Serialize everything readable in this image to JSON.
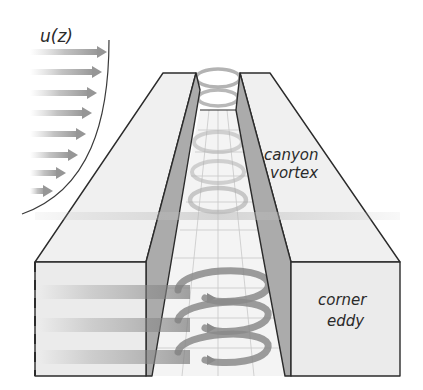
{
  "figure": {
    "labels": {
      "profile": "u(z)",
      "canyon_vortex_line1": "canyon",
      "canyon_vortex_line2": "vortex",
      "corner_eddy_line1": "corner",
      "corner_eddy_line2": "eddy"
    },
    "colors": {
      "building_face": "#ececec",
      "building_top": "#f2f2f2",
      "inner_wall": "#a9a9a9",
      "outline": "#2b2b2b",
      "arrow": "#9a9a9a",
      "vortex": "#8f8f8f",
      "grid": "#c4c4c4",
      "background": "#ffffff"
    },
    "profile_arrows": [
      {
        "y": 52,
        "x_end": 107
      },
      {
        "y": 72,
        "x_end": 102
      },
      {
        "y": 93,
        "x_end": 97
      },
      {
        "y": 113,
        "x_end": 92
      },
      {
        "y": 134,
        "x_end": 86
      },
      {
        "y": 155,
        "x_end": 78
      },
      {
        "y": 173,
        "x_end": 66
      },
      {
        "y": 191,
        "x_end": 53
      }
    ]
  }
}
